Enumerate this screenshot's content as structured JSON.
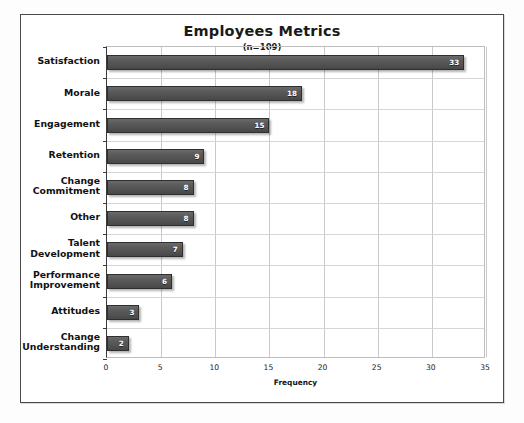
{
  "ghost_text": "",
  "chart_data": {
    "type": "bar",
    "orientation": "horizontal",
    "title": "Employees Metrics",
    "subtitle": "(n=109)",
    "xlabel": "Frequency",
    "ylabel": "",
    "xlim": [
      0,
      35
    ],
    "xticks": [
      0,
      5,
      10,
      15,
      20,
      25,
      30,
      35
    ],
    "grid": true,
    "legend": false,
    "bar_color": "#555555",
    "categories": [
      "Satisfaction",
      "Morale",
      "Engagement",
      "Retention",
      "Change\nCommitment",
      "Other",
      "Talent\nDevelopment",
      "Performance\nImprovement",
      "Attitudes",
      "Change\nUnderstanding"
    ],
    "values": [
      33,
      18,
      15,
      9,
      8,
      8,
      7,
      6,
      3,
      2
    ],
    "value_labels": [
      "33",
      "18",
      "15",
      "9",
      "8",
      "8",
      "7",
      "6",
      "3",
      "2"
    ]
  }
}
